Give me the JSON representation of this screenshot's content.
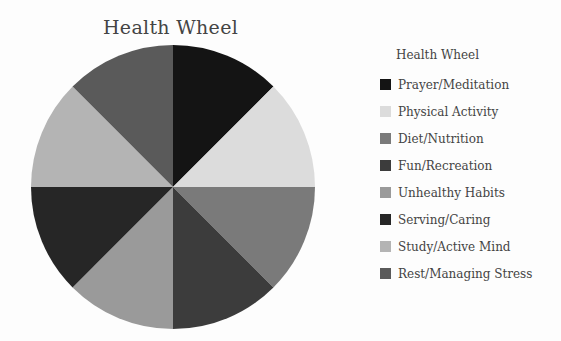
{
  "chart_data": {
    "type": "pie",
    "title": "Health Wheel",
    "legend_title": "Health Wheel",
    "legend_position": "right",
    "categories": [
      "Prayer/Meditation",
      "Physical Activity",
      "Diet/Nutrition",
      "Fun/Recreation",
      "Unhealthy Habits",
      "Serving/Caring",
      "Study/Active Mind",
      "Rest/Managing Stress"
    ],
    "values": [
      12.5,
      12.5,
      12.5,
      12.5,
      12.5,
      12.5,
      12.5,
      12.5
    ],
    "colors": [
      "#141414",
      "#dcdcdc",
      "#7a7a7a",
      "#3c3c3c",
      "#9a9a9a",
      "#262626",
      "#b4b4b4",
      "#5a5a5a"
    ]
  },
  "legend": {
    "items": [
      {
        "label": "Prayer/Meditation"
      },
      {
        "label": "Physical Activity"
      },
      {
        "label": "Diet/Nutrition"
      },
      {
        "label": "Fun/Recreation"
      },
      {
        "label": "Unhealthy Habits"
      },
      {
        "label": "Serving/Caring"
      },
      {
        "label": "Study/Active Mind"
      },
      {
        "label": "Rest/Managing Stress"
      }
    ]
  }
}
